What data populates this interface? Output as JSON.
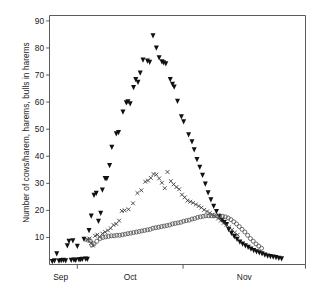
{
  "chart_data": {
    "type": "scatter",
    "title": "",
    "xlabel": "",
    "ylabel": "Number of cows/harem, harems, bulls in harems",
    "ylim": [
      0,
      92
    ],
    "yticks": [
      10,
      20,
      30,
      40,
      50,
      60,
      70,
      80,
      90
    ],
    "ytick_labels": [
      "10",
      "20",
      "30",
      "40",
      "50",
      "60",
      "70",
      "80",
      "90"
    ],
    "xlim": [
      0,
      92
    ],
    "xticks": [
      10,
      48,
      92
    ],
    "xtick_labels": [
      "",
      "",
      ""
    ],
    "month_labels": [
      "Sep",
      "Oct",
      "Nov"
    ],
    "month_label_positions": [
      4,
      29,
      70
    ],
    "grid": false,
    "legend": "none",
    "series": [
      {
        "name": "cows per harem",
        "marker": "filled-down-triangle",
        "color": "#111111",
        "points": [
          [
            1.0,
            1.2
          ],
          [
            1.8,
            1.4
          ],
          [
            2.6,
            4.0
          ],
          [
            3.4,
            1.3
          ],
          [
            4.2,
            1.5
          ],
          [
            5.0,
            1.6
          ],
          [
            5.8,
            1.4
          ],
          [
            6.4,
            7.0
          ],
          [
            7.0,
            8.6
          ],
          [
            7.8,
            1.6
          ],
          [
            8.4,
            8.8
          ],
          [
            8.8,
            1.7
          ],
          [
            9.4,
            1.6
          ],
          [
            10.0,
            6.8
          ],
          [
            10.6,
            1.8
          ],
          [
            11.2,
            1.9
          ],
          [
            11.8,
            2.0
          ],
          [
            12.4,
            9.4
          ],
          [
            13.0,
            2.1
          ],
          [
            13.6,
            2.0
          ],
          [
            14.2,
            12.6
          ],
          [
            15.0,
            18.0
          ],
          [
            16.0,
            25.6
          ],
          [
            16.8,
            26.4
          ],
          [
            17.6,
            16.0
          ],
          [
            18.4,
            19.0
          ],
          [
            19.0,
            27.6
          ],
          [
            20.0,
            31.8
          ],
          [
            20.6,
            31.8
          ],
          [
            21.6,
            36.6
          ],
          [
            22.4,
            43.4
          ],
          [
            24.0,
            48.4
          ],
          [
            24.8,
            48.8
          ],
          [
            26.4,
            56.4
          ],
          [
            27.6,
            59.8
          ],
          [
            28.2,
            60.2
          ],
          [
            29.0,
            59.4
          ],
          [
            30.2,
            65.4
          ],
          [
            31.0,
            68.4
          ],
          [
            31.8,
            67.4
          ],
          [
            32.6,
            70.8
          ],
          [
            33.6,
            75.6
          ],
          [
            35.2,
            75.2
          ],
          [
            36.0,
            74.8
          ],
          [
            37.2,
            84.6
          ],
          [
            38.4,
            80.0
          ],
          [
            39.4,
            76.4
          ],
          [
            40.4,
            75.0
          ],
          [
            41.0,
            74.6
          ],
          [
            41.8,
            74.2
          ],
          [
            43.4,
            68.4
          ],
          [
            44.2,
            66.6
          ],
          [
            44.8,
            65.6
          ],
          [
            46.0,
            60.4
          ],
          [
            47.4,
            54.6
          ],
          [
            48.2,
            52.8
          ],
          [
            50.0,
            48.0
          ],
          [
            51.2,
            45.4
          ],
          [
            52.0,
            42.4
          ],
          [
            53.0,
            38.8
          ],
          [
            54.0,
            36.0
          ],
          [
            55.0,
            33.0
          ],
          [
            56.0,
            29.8
          ],
          [
            57.0,
            26.6
          ],
          [
            58.0,
            24.0
          ],
          [
            59.0,
            21.6
          ],
          [
            60.0,
            19.6
          ],
          [
            61.0,
            17.8
          ],
          [
            62.0,
            16.4
          ],
          [
            62.8,
            15.6
          ],
          [
            63.6,
            14.8
          ],
          [
            64.4,
            13.0
          ],
          [
            65.4,
            11.6
          ],
          [
            66.4,
            10.4
          ],
          [
            67.4,
            9.4
          ],
          [
            68.4,
            8.4
          ],
          [
            69.4,
            7.6
          ],
          [
            70.4,
            7.0
          ],
          [
            71.4,
            6.4
          ],
          [
            72.4,
            5.8
          ],
          [
            73.4,
            5.2
          ],
          [
            74.4,
            4.8
          ],
          [
            75.4,
            4.4
          ],
          [
            76.4,
            4.0
          ],
          [
            77.4,
            3.6
          ],
          [
            78.4,
            3.2
          ],
          [
            79.4,
            3.0
          ],
          [
            80.4,
            2.8
          ],
          [
            81.4,
            2.6
          ],
          [
            82.4,
            2.4
          ],
          [
            83.4,
            2.2
          ]
        ]
      },
      {
        "name": "harems",
        "marker": "cross",
        "color": "#333333",
        "points": [
          [
            13.6,
            9.2
          ],
          [
            14.4,
            9.6
          ],
          [
            15.0,
            8.0
          ],
          [
            15.6,
            7.0
          ],
          [
            16.4,
            10.6
          ],
          [
            17.2,
            11.0
          ],
          [
            18.0,
            10.2
          ],
          [
            19.0,
            11.4
          ],
          [
            20.0,
            12.0
          ],
          [
            21.0,
            12.6
          ],
          [
            22.0,
            13.4
          ],
          [
            23.0,
            14.6
          ],
          [
            24.0,
            15.0
          ],
          [
            25.0,
            16.2
          ],
          [
            26.0,
            19.8
          ],
          [
            27.0,
            20.0
          ],
          [
            28.4,
            20.4
          ],
          [
            30.0,
            22.6
          ],
          [
            31.6,
            26.4
          ],
          [
            33.0,
            27.4
          ],
          [
            34.4,
            30.6
          ],
          [
            35.4,
            31.0
          ],
          [
            36.4,
            32.0
          ],
          [
            37.4,
            33.4
          ],
          [
            38.4,
            33.2
          ],
          [
            39.4,
            31.8
          ],
          [
            40.4,
            30.2
          ],
          [
            41.4,
            28.2
          ],
          [
            42.4,
            34.2
          ],
          [
            43.6,
            30.8
          ],
          [
            44.6,
            29.6
          ],
          [
            45.6,
            28.6
          ],
          [
            46.6,
            27.8
          ],
          [
            47.6,
            25.8
          ],
          [
            48.6,
            24.8
          ],
          [
            49.6,
            23.6
          ],
          [
            50.6,
            23.2
          ],
          [
            51.6,
            22.8
          ],
          [
            52.6,
            22.2
          ],
          [
            53.6,
            21.6
          ],
          [
            54.6,
            21.0
          ],
          [
            55.6,
            20.2
          ],
          [
            56.6,
            19.6
          ],
          [
            57.6,
            19.0
          ],
          [
            58.6,
            18.4
          ],
          [
            59.6,
            17.8
          ],
          [
            60.6,
            17.0
          ],
          [
            61.6,
            16.2
          ],
          [
            62.6,
            15.4
          ],
          [
            63.6,
            14.6
          ],
          [
            64.6,
            13.8
          ],
          [
            65.6,
            12.8
          ],
          [
            66.6,
            11.8
          ],
          [
            67.6,
            11.0
          ]
        ]
      },
      {
        "name": "bulls in harems",
        "marker": "open-circle",
        "color": "#555555",
        "points": [
          [
            13.8,
            9.0
          ],
          [
            14.6,
            8.8
          ],
          [
            15.2,
            7.2
          ],
          [
            16.0,
            7.6
          ],
          [
            17.0,
            8.6
          ],
          [
            18.2,
            9.6
          ],
          [
            19.2,
            10.0
          ],
          [
            20.2,
            10.2
          ],
          [
            21.2,
            10.4
          ],
          [
            22.2,
            10.6
          ],
          [
            23.2,
            10.6
          ],
          [
            24.2,
            10.8
          ],
          [
            25.2,
            10.8
          ],
          [
            26.2,
            11.0
          ],
          [
            27.2,
            11.2
          ],
          [
            28.2,
            11.4
          ],
          [
            29.2,
            11.6
          ],
          [
            30.2,
            11.8
          ],
          [
            31.2,
            12.0
          ],
          [
            32.2,
            12.2
          ],
          [
            33.2,
            12.4
          ],
          [
            34.2,
            12.6
          ],
          [
            35.2,
            12.8
          ],
          [
            36.2,
            13.0
          ],
          [
            37.2,
            13.4
          ],
          [
            38.2,
            13.6
          ],
          [
            39.2,
            13.8
          ],
          [
            40.2,
            14.0
          ],
          [
            41.2,
            14.2
          ],
          [
            42.2,
            14.4
          ],
          [
            43.2,
            14.6
          ],
          [
            44.2,
            15.0
          ],
          [
            45.2,
            15.2
          ],
          [
            46.2,
            15.4
          ],
          [
            47.2,
            15.6
          ],
          [
            48.2,
            16.0
          ],
          [
            49.2,
            16.2
          ],
          [
            50.2,
            16.4
          ],
          [
            51.2,
            16.8
          ],
          [
            52.2,
            17.0
          ],
          [
            53.2,
            17.4
          ],
          [
            54.2,
            17.6
          ],
          [
            55.2,
            17.8
          ],
          [
            56.2,
            18.0
          ],
          [
            57.2,
            18.0
          ],
          [
            58.2,
            18.0
          ],
          [
            59.2,
            18.0
          ],
          [
            60.2,
            18.0
          ],
          [
            61.2,
            18.0
          ],
          [
            62.2,
            17.8
          ],
          [
            63.2,
            17.6
          ],
          [
            64.2,
            17.2
          ],
          [
            65.2,
            16.6
          ],
          [
            66.2,
            15.8
          ],
          [
            67.2,
            15.0
          ],
          [
            68.2,
            14.0
          ],
          [
            69.2,
            13.0
          ],
          [
            70.2,
            12.0
          ],
          [
            71.2,
            10.8
          ],
          [
            72.2,
            9.6
          ],
          [
            73.2,
            8.6
          ],
          [
            74.2,
            7.6
          ],
          [
            75.2,
            6.8
          ],
          [
            76.2,
            6.0
          ]
        ]
      }
    ]
  }
}
